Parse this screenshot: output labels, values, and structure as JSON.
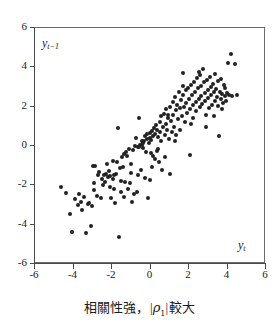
{
  "chart_data": {
    "type": "scatter",
    "title": "",
    "caption_text": "相關性強，|ρ₁| 較大",
    "caption_prefix": "相關性強，",
    "caption_rho": "ρ",
    "caption_rho_sub": "1",
    "caption_suffix": "較大",
    "caption_bar": "|",
    "xlabel": "y",
    "xlabel_sub": "t",
    "ylabel": "y",
    "ylabel_sub": "t−1",
    "xlim": [
      -6,
      6
    ],
    "ylim": [
      -6,
      6
    ],
    "grid": false,
    "legend": "none",
    "marker_color": "#222222",
    "axis_color": "#4a4a4a",
    "background_color": "#ffffff",
    "xticks": [
      "-6",
      "-4",
      "-2",
      "0",
      "2",
      "4",
      "6"
    ],
    "xtick_values": [
      -6,
      -4,
      -2,
      0,
      2,
      4,
      6
    ],
    "yticks": [
      "6",
      "4",
      "2",
      "0",
      "-2",
      "-4",
      "-6"
    ],
    "ytick_values": [
      6,
      4,
      2,
      0,
      -2,
      -4,
      -6
    ],
    "n_points": 196,
    "correlation_note": "strong positive correlation",
    "points": [
      [
        -4.6,
        -2.15
      ],
      [
        -4.32,
        -2.42
      ],
      [
        -4.15,
        -3.52
      ],
      [
        -4.02,
        -4.4
      ],
      [
        -3.85,
        -2.75
      ],
      [
        -3.72,
        -3.05
      ],
      [
        -3.58,
        -2.88
      ],
      [
        -3.5,
        -3.28
      ],
      [
        -3.42,
        -2.62
      ],
      [
        -3.3,
        -4.45
      ],
      [
        -3.22,
        -3.02
      ],
      [
        -3.12,
        -2.95
      ],
      [
        -3.05,
        -4.1
      ],
      [
        -2.98,
        -3.08
      ],
      [
        -2.9,
        -2.3
      ],
      [
        -2.82,
        -1.05
      ],
      [
        -2.75,
        -2.58
      ],
      [
        -2.68,
        -1.52
      ],
      [
        -2.6,
        -1.35
      ],
      [
        -2.52,
        -2.72
      ],
      [
        -2.45,
        -1.75
      ],
      [
        -2.38,
        -1.52
      ],
      [
        -2.3,
        -1.88
      ],
      [
        -2.25,
        -1.45
      ],
      [
        -2.18,
        -1.62
      ],
      [
        -2.12,
        -1.3
      ],
      [
        -2.05,
        -1.58
      ],
      [
        -1.98,
        -2.68
      ],
      [
        -1.92,
        -1.72
      ],
      [
        -1.88,
        -0.8
      ],
      [
        -1.82,
        -1.5
      ],
      [
        -1.78,
        -2.95
      ],
      [
        -1.72,
        -1.48
      ],
      [
        -1.68,
        -0.88
      ],
      [
        -1.62,
        0.88
      ],
      [
        -1.6,
        -4.68
      ],
      [
        -1.55,
        -1.18
      ],
      [
        -1.5,
        -2.38
      ],
      [
        -1.45,
        -0.62
      ],
      [
        -1.4,
        -1.12
      ],
      [
        -1.35,
        -2.62
      ],
      [
        -1.3,
        -0.45
      ],
      [
        -1.25,
        -1.9
      ],
      [
        -1.2,
        -0.35
      ],
      [
        -1.15,
        -0.55
      ],
      [
        -1.1,
        -2.25
      ],
      [
        -1.05,
        -0.2
      ],
      [
        -1.0,
        -1.95
      ],
      [
        -0.95,
        -0.98
      ],
      [
        -0.9,
        -2.88
      ],
      [
        -0.85,
        -0.25
      ],
      [
        -0.8,
        -2.48
      ],
      [
        -0.75,
        -0.05
      ],
      [
        -0.7,
        0.38
      ],
      [
        -0.65,
        -2.38
      ],
      [
        -0.6,
        -0.12
      ],
      [
        -0.55,
        1.38
      ],
      [
        -0.52,
        -0.08
      ],
      [
        -0.48,
        0.02
      ],
      [
        -0.45,
        -1.28
      ],
      [
        -0.4,
        0.18
      ],
      [
        -0.38,
        -0.02
      ],
      [
        -0.35,
        0.08
      ],
      [
        -0.32,
        -0.15
      ],
      [
        -0.28,
        0.22
      ],
      [
        -0.25,
        -1.7
      ],
      [
        -0.22,
        0.45
      ],
      [
        -0.18,
        -0.35
      ],
      [
        -0.15,
        0.3
      ],
      [
        -0.12,
        0.55
      ],
      [
        -0.08,
        -2.7
      ],
      [
        -0.05,
        0.12
      ],
      [
        0.0,
        -1.78
      ],
      [
        0.02,
        0.62
      ],
      [
        0.05,
        0.35
      ],
      [
        0.08,
        -0.42
      ],
      [
        0.1,
        0.25
      ],
      [
        0.14,
        0.7
      ],
      [
        0.18,
        -0.55
      ],
      [
        0.2,
        0.48
      ],
      [
        0.24,
        0.85
      ],
      [
        0.28,
        -0.72
      ],
      [
        0.3,
        0.58
      ],
      [
        0.34,
        1.02
      ],
      [
        0.38,
        -0.3
      ],
      [
        0.4,
        0.75
      ],
      [
        0.44,
        0.4
      ],
      [
        0.48,
        -0.88
      ],
      [
        0.52,
        1.18
      ],
      [
        0.55,
        0.65
      ],
      [
        0.58,
        0.2
      ],
      [
        0.62,
        1.45
      ],
      [
        0.66,
        -1.25
      ],
      [
        0.7,
        0.92
      ],
      [
        0.74,
        1.6
      ],
      [
        0.78,
        0.5
      ],
      [
        0.82,
        -0.62
      ],
      [
        0.85,
        1.08
      ],
      [
        0.88,
        1.82
      ],
      [
        0.92,
        0.78
      ],
      [
        0.96,
        1.35
      ],
      [
        1.0,
        0.3
      ],
      [
        1.04,
        1.95
      ],
      [
        1.08,
        -1.48
      ],
      [
        1.12,
        1.22
      ],
      [
        1.16,
        0.68
      ],
      [
        1.2,
        2.18
      ],
      [
        1.24,
        1.55
      ],
      [
        1.28,
        0.92
      ],
      [
        1.32,
        2.42
      ],
      [
        1.36,
        1.78
      ],
      [
        1.4,
        0.52
      ],
      [
        1.44,
        2.05
      ],
      [
        1.48,
        1.32
      ],
      [
        1.52,
        2.68
      ],
      [
        1.56,
        1.88
      ],
      [
        1.6,
        0.75
      ],
      [
        1.64,
        2.28
      ],
      [
        1.68,
        1.48
      ],
      [
        1.72,
        3.68
      ],
      [
        1.76,
        2.52
      ],
      [
        1.8,
        1.95
      ],
      [
        1.84,
        1.15
      ],
      [
        1.88,
        2.78
      ],
      [
        1.92,
        2.12
      ],
      [
        1.96,
        1.62
      ],
      [
        2.0,
        2.92
      ],
      [
        2.04,
        2.35
      ],
      [
        2.08,
        1.82
      ],
      [
        2.12,
        -0.52
      ],
      [
        2.16,
        3.05
      ],
      [
        2.2,
        2.55
      ],
      [
        2.24,
        2.02
      ],
      [
        2.28,
        1.38
      ],
      [
        2.32,
        3.22
      ],
      [
        2.36,
        2.72
      ],
      [
        2.4,
        2.18
      ],
      [
        2.44,
        1.72
      ],
      [
        2.48,
        3.42
      ],
      [
        2.52,
        2.88
      ],
      [
        2.56,
        2.32
      ],
      [
        2.6,
        1.95
      ],
      [
        2.64,
        3.58
      ],
      [
        2.68,
        3.02
      ],
      [
        2.7,
        2.48
      ],
      [
        2.74,
        2.08
      ],
      [
        2.78,
        3.88
      ],
      [
        2.82,
        3.18
      ],
      [
        2.86,
        2.62
      ],
      [
        2.9,
        2.22
      ],
      [
        2.94,
        1.52
      ],
      [
        2.98,
        3.32
      ],
      [
        3.02,
        2.78
      ],
      [
        3.06,
        2.38
      ],
      [
        3.1,
        1.88
      ],
      [
        3.14,
        3.48
      ],
      [
        3.18,
        2.95
      ],
      [
        3.22,
        2.52
      ],
      [
        3.26,
        2.05
      ],
      [
        3.3,
        3.12
      ],
      [
        3.34,
        2.68
      ],
      [
        3.38,
        2.25
      ],
      [
        3.42,
        3.62
      ],
      [
        3.46,
        2.85
      ],
      [
        3.5,
        2.42
      ],
      [
        3.54,
        1.98
      ],
      [
        3.58,
        3.25
      ],
      [
        3.62,
        0.48
      ],
      [
        3.66,
        2.72
      ],
      [
        3.7,
        2.32
      ],
      [
        3.74,
        3.38
      ],
      [
        3.78,
        2.58
      ],
      [
        3.82,
        2.15
      ],
      [
        3.86,
        3.05
      ],
      [
        3.9,
        2.48
      ],
      [
        3.94,
        2.88
      ],
      [
        3.98,
        2.25
      ],
      [
        4.05,
        2.62
      ],
      [
        4.1,
        4.18
      ],
      [
        4.15,
        2.55
      ],
      [
        4.22,
        4.62
      ],
      [
        4.3,
        2.48
      ],
      [
        4.42,
        4.12
      ],
      [
        4.55,
        2.55
      ],
      [
        -2.95,
        -1.08
      ],
      [
        -2.42,
        -2.02
      ],
      [
        -2.05,
        -2.12
      ],
      [
        -1.48,
        -1.82
      ],
      [
        -0.98,
        -1.42
      ],
      [
        -0.58,
        -1.55
      ],
      [
        0.12,
        -1.12
      ],
      [
        0.45,
        -0.18
      ],
      [
        0.95,
        1.52
      ],
      [
        1.35,
        0.18
      ],
      [
        1.75,
        2.98
      ],
      [
        2.15,
        1.05
      ],
      [
        2.55,
        3.72
      ],
      [
        2.95,
        0.92
      ],
      [
        3.35,
        1.45
      ],
      [
        3.75,
        1.82
      ],
      [
        -3.65,
        -2.48
      ],
      [
        -2.88,
        -1.95
      ],
      [
        -2.22,
        -0.98
      ],
      [
        -1.85,
        -2.25
      ]
    ]
  }
}
